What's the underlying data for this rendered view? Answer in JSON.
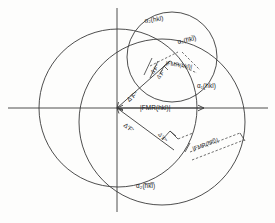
{
  "figure": {
    "background_color": "#fdfdfc",
    "line_color": "#3a3a3a"
  },
  "axes": {
    "horizontal_label": "",
    "vertical_label": "",
    "origin_marker": "origin"
  },
  "circles": [
    {
      "name": "native-circle",
      "cx": 118,
      "cy": 108,
      "r": 79,
      "label": ""
    },
    {
      "name": "derivative-circle-plus",
      "cx": 172,
      "cy": 57,
      "r": 45,
      "label": ""
    },
    {
      "name": "derivative-circle-minus",
      "cx": 162,
      "cy": 122,
      "r": 83,
      "label": ""
    }
  ],
  "labels": {
    "alpha2_hkl": "α₂(hkl)",
    "alpha1_hkl_bar": "α₁(h̅k̅l̅)",
    "alpha1_hkl": "α₁(hkl)",
    "alpha2_hkl_bar": "α₂(h̅k̅l̅)",
    "fmr_hkl_upper": "|FMR(hkl)|",
    "fmr_hkl_center": "|FMR(hkl)|",
    "fmr_hkl_bar": "|FMR(h̅k̅l̅)|",
    "delta_f_prime_upper": "Δ'F\"",
    "delta_f_prime_upper2": "Δ'F'",
    "delta_f_prime_lower": "Δ'F'",
    "delta_f_prime_lower2": "Δ'F\""
  },
  "label_meta": [
    {
      "key": "alpha2_hkl",
      "text": "α₂(hkl)",
      "x": 144,
      "y": 18,
      "rot": -8,
      "name": "label-alpha2-hkl"
    },
    {
      "key": "alpha1_hkl_bar",
      "text": "α₁(h̅k̅l̅)",
      "x": 178,
      "y": 40,
      "rot": -12,
      "name": "label-alpha1-hkl-bar"
    },
    {
      "key": "alpha1_hkl",
      "text": "α₁(hkl)",
      "x": 196,
      "y": 84,
      "rot": 0,
      "name": "label-alpha1-hkl"
    },
    {
      "key": "alpha2_hkl_bar",
      "text": "α₂(h̅k̅l̅)",
      "x": 136,
      "y": 183,
      "rot": 0,
      "name": "label-alpha2-hkl-bar"
    },
    {
      "key": "fmr_hkl_upper",
      "text": "|FMR(hkl)|",
      "x": 165,
      "y": 62,
      "rot": 8,
      "name": "label-fmr-hkl-upper"
    },
    {
      "key": "fmr_hkl_center",
      "text": "|FMR(hkl)|",
      "x": 140,
      "y": 106,
      "rot": 0,
      "name": "label-fmr-hkl-center"
    },
    {
      "key": "fmr_hkl_bar",
      "text": "|FMR(h̅k̅l̅)|",
      "x": 196,
      "y": 145,
      "rot": -20,
      "name": "label-fmr-hkl-bar"
    }
  ],
  "vectors": [
    {
      "name": "vector-fmr-hkl",
      "from": [
        117,
        108
      ],
      "to": [
        201,
        108
      ],
      "label": "|FMR(hkl)|"
    },
    {
      "name": "vector-delta-f-upper",
      "from": [
        117,
        108
      ],
      "to": [
        168,
        63
      ],
      "label": "Δ'F\""
    },
    {
      "name": "vector-delta-f-lower",
      "from": [
        117,
        108
      ],
      "to": [
        172,
        148
      ],
      "label": "Δ'F'"
    }
  ],
  "annotations": {
    "right_angle_marker_upper": "right-angle",
    "right_angle_marker_lower": "right-angle",
    "arrowheads": 3
  }
}
